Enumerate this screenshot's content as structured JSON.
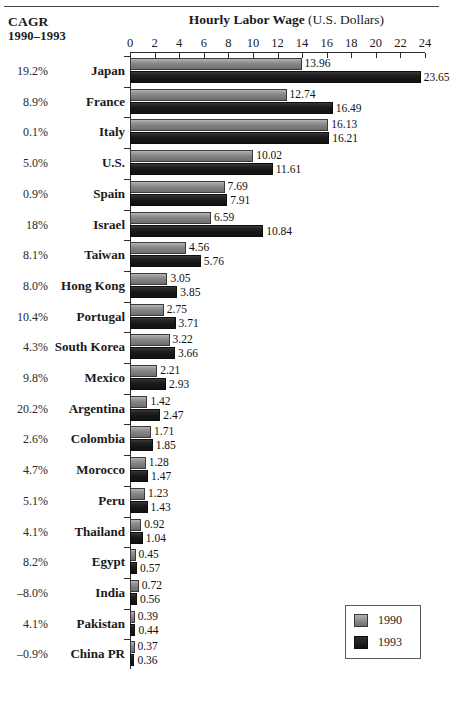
{
  "header": {
    "cagr_title_line1": "CAGR",
    "cagr_title_line2": "1990–1993",
    "chart_title_strong": "Hourly Labor Wage",
    "chart_title_light": " (U.S. Dollars)"
  },
  "legend": {
    "items": [
      {
        "label": "1990",
        "color": "#808080"
      },
      {
        "label": "1993",
        "color": "#161616"
      }
    ]
  },
  "chart_data": {
    "type": "bar",
    "orientation": "horizontal",
    "title": "Hourly Labor Wage (U.S. Dollars)",
    "xlabel": "Hourly Labor Wage (U.S. Dollars)",
    "ylabel": "",
    "xlim": [
      0,
      24
    ],
    "xticks": [
      0,
      2,
      4,
      6,
      8,
      10,
      12,
      14,
      16,
      18,
      20,
      22,
      24
    ],
    "grid": false,
    "legend_position": "bottom-right",
    "categories": [
      "Japan",
      "France",
      "Italy",
      "U.S.",
      "Spain",
      "Israel",
      "Taiwan",
      "Hong Kong",
      "Portugal",
      "South Korea",
      "Mexico",
      "Argentina",
      "Colombia",
      "Morocco",
      "Peru",
      "Thailand",
      "Egypt",
      "India",
      "Pakistan",
      "China PR"
    ],
    "series": [
      {
        "name": "1990",
        "color": "#808080",
        "values": [
          13.96,
          12.74,
          16.13,
          10.02,
          7.69,
          6.59,
          4.56,
          3.05,
          2.75,
          3.22,
          2.21,
          1.42,
          1.71,
          1.28,
          1.23,
          0.92,
          0.45,
          0.72,
          0.39,
          0.37
        ],
        "labels": [
          "13.96",
          "12.74",
          "16.13",
          "10.02",
          "7.69",
          "6.59",
          "4.56",
          "3.05",
          "2.75",
          "3.22",
          "2.21",
          "1.42",
          "1.71",
          "1.28",
          "1.23",
          "0.92",
          "0.45",
          "0.72",
          "0.39",
          "0.37"
        ]
      },
      {
        "name": "1993",
        "color": "#161616",
        "values": [
          23.65,
          16.49,
          16.21,
          11.61,
          7.91,
          10.84,
          5.76,
          3.85,
          3.71,
          3.66,
          2.93,
          2.47,
          1.85,
          1.47,
          1.43,
          1.04,
          0.57,
          0.56,
          0.44,
          0.36
        ],
        "labels": [
          "23.65",
          "16.49",
          "16.21",
          "11.61",
          "7.91",
          "10.84",
          "5.76",
          "3.85",
          "3.71",
          "3.66",
          "2.93",
          "2.47",
          "1.85",
          "1.47",
          "1.43",
          "1.04",
          "0.57",
          "0.56",
          "0.44",
          "0.36"
        ]
      }
    ],
    "annotations": {
      "cagr_column_header": "CAGR 1990–1993",
      "cagr_values": [
        "19.2%",
        "8.9%",
        "0.1%",
        "5.0%",
        "0.9%",
        "18%",
        "8.1%",
        "8.0%",
        "10.4%",
        "4.3%",
        "9.8%",
        "20.2%",
        "2.6%",
        "4.7%",
        "5.1%",
        "4.1%",
        "8.2%",
        "–8.0%",
        "4.1%",
        "–0.9%"
      ]
    }
  }
}
